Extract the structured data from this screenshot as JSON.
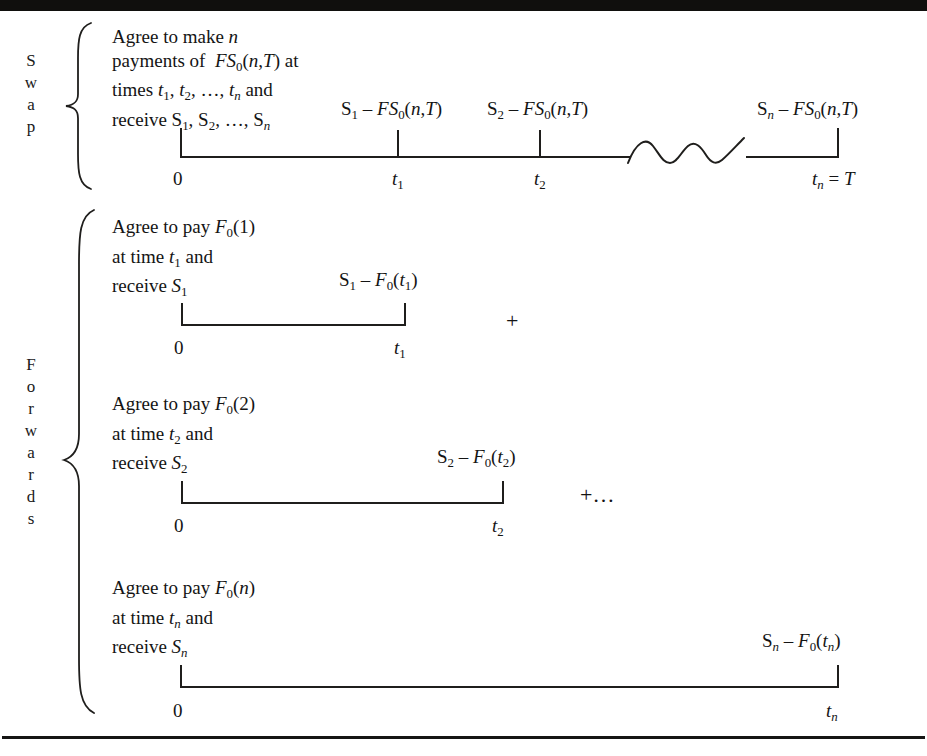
{
  "figure": {
    "groups": [
      {
        "id": "swap",
        "vertical_label_letters": [
          "S",
          "w",
          "a",
          "p"
        ],
        "label_text": "Swap",
        "description_lines": [
          "Agree to make n",
          "payments of  FS₀(n,T) at",
          "times t₁, t₂, …, tₙ and",
          "receive S₁, S₂, …, Sₙ"
        ],
        "payoffs": [
          "S₁ − FS₀(n,T)",
          "S₂ − FS₀(n,T)",
          "Sₙ − FS₀(n,T)"
        ],
        "tick_labels": [
          "0",
          "t₁",
          "t₂",
          "tₙ = T"
        ],
        "has_squiggle_break": true
      },
      {
        "id": "forwards",
        "vertical_label_letters": [
          "F",
          "o",
          "r",
          "w",
          "a",
          "r",
          "d",
          "s"
        ],
        "label_text": "Forwards",
        "rows": [
          {
            "id": "forward-1",
            "description_lines": [
              "Agree to pay F₀(1)",
              "at time t₁ and",
              "receive S₁"
            ],
            "payoff": "S₁ − F₀(t₁)",
            "tick_labels": [
              "0",
              "t₁"
            ],
            "operator": "+"
          },
          {
            "id": "forward-2",
            "description_lines": [
              "Agree to pay F₀(2)",
              "at time t₂ and",
              "receive S₂"
            ],
            "payoff": "S₂ − F₀(t₂)",
            "tick_labels": [
              "0",
              "t₂"
            ],
            "operator": "+…"
          },
          {
            "id": "forward-3",
            "description_lines": [
              "Agree to pay F₀(n)",
              "at time tₙ and",
              "receive Sₙ"
            ],
            "payoff": "Sₙ − F₀(tₙ)",
            "tick_labels": [
              "0",
              "tₙ"
            ],
            "operator": ""
          }
        ]
      }
    ],
    "colors": {
      "ink": "#1a1a1a",
      "rule": "#161514",
      "bar": "#100f0d",
      "page": "#ffffff"
    }
  }
}
